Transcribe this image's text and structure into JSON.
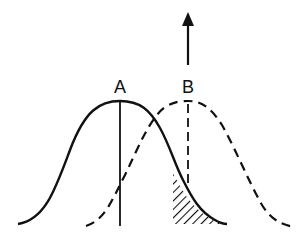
{
  "diagram": {
    "labels": {
      "a": "A",
      "b": "B"
    },
    "curves": [
      {
        "name": "distribution-A",
        "style": "solid",
        "peak_x": 120
      },
      {
        "name": "distribution-B",
        "style": "dashed",
        "peak_x": 188
      }
    ],
    "shaded_region": "overlap tail of A beyond threshold",
    "arrow": {
      "direction": "up",
      "position": "above B"
    },
    "colors": {
      "ink": "#111111",
      "background": "#ffffff"
    }
  }
}
